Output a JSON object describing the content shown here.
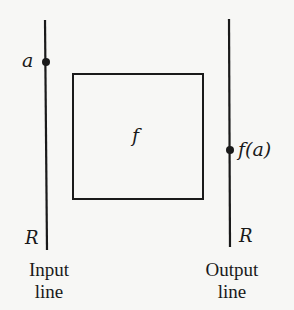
{
  "diagram": {
    "input_point_label": "a",
    "output_point_label": "f(a)",
    "function_label": "f",
    "input_axis_label": "R",
    "output_axis_label": "R",
    "input_caption_line1": "Input",
    "input_caption_line2": "line",
    "output_caption_line1": "Output",
    "output_caption_line2": "line",
    "colors": {
      "ink": "#1a1a1a",
      "background": "#f7f7f5"
    }
  }
}
